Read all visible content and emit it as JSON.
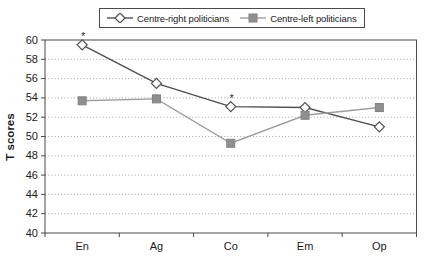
{
  "chart_data": {
    "type": "line",
    "title": "",
    "xlabel": "",
    "ylabel": "T scores",
    "categories": [
      "En",
      "Ag",
      "Co",
      "Em",
      "Op"
    ],
    "series": [
      {
        "name": "Centre-right politicians",
        "marker": "diamond",
        "line_color": "#4f4f4f",
        "marker_fill": "#ffffff",
        "marker_stroke": "#4f4f4f",
        "values": [
          59.5,
          55.5,
          53.1,
          53.0,
          51.0
        ]
      },
      {
        "name": "Centre-left politicians",
        "marker": "square",
        "line_color": "#9e9e9e",
        "marker_fill": "#8f8f8f",
        "marker_stroke": "#828282",
        "values": [
          53.7,
          53.9,
          49.3,
          52.2,
          53.0
        ]
      }
    ],
    "annotations": [
      {
        "text": "*",
        "series_index": 0,
        "category_index": 0
      },
      {
        "text": "*",
        "series_index": 0,
        "category_index": 2
      }
    ],
    "ylim": [
      40,
      60
    ],
    "yticks": [
      40,
      42,
      44,
      46,
      48,
      50,
      52,
      54,
      56,
      58,
      60
    ],
    "grid": "horizontal-dotted",
    "legend_position": "top-center",
    "colors": {
      "grid": "#a6a6a6",
      "axis": "#4a4a4a",
      "text": "#1a1a1a",
      "background": "#ffffff",
      "legend_border": "#4a4a4a"
    }
  }
}
